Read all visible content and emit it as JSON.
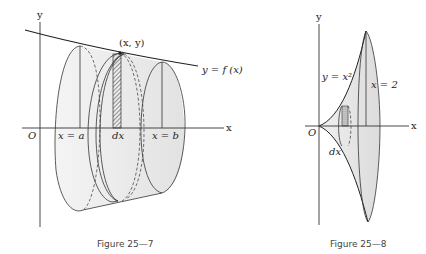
{
  "figures": [
    {
      "caption": "Figure 25—7",
      "labels": {
        "y_axis": "y",
        "x_axis": "x",
        "origin": "O",
        "point": "(x, y)",
        "curve": "y = f (x)",
        "left_bound": "x = a",
        "right_bound": "x = b",
        "width": "dx"
      }
    },
    {
      "caption": "Figure 25—8",
      "labels": {
        "y_axis": "y",
        "x_axis": "x",
        "origin": "O",
        "curve": "y = x²",
        "right_bound": "x = 2",
        "width": "dx"
      }
    }
  ],
  "colors": {
    "line": "#333333",
    "shade": "#e6e6e6"
  }
}
